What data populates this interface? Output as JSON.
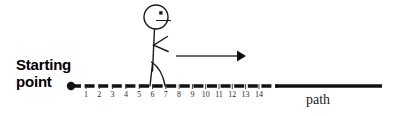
{
  "diagram": {
    "title_label": {
      "line1": "Starting",
      "line2": "point"
    },
    "path_label": "path",
    "axis": {
      "tick_labels": [
        "1",
        "2",
        "3",
        "4",
        "5",
        "6",
        "7",
        "8",
        "9",
        "10",
        "11",
        "12",
        "13",
        "14"
      ],
      "tick_start_x": 86,
      "tick_spacing": 13.3,
      "baseline_y": 86,
      "start_dot_x": 71,
      "dashed_end_x": 278,
      "line_end_x": 382
    },
    "figure": {
      "head_center_x": 156,
      "head_center_y": 17,
      "head_radius": 12,
      "eye_label": "eye-dot",
      "mouth_label": "mouth-line",
      "arm_label": "arm-chevron",
      "leg_label": "legs-walking"
    },
    "arrow": {
      "label": "motion-arrow",
      "start_x": 176,
      "end_x": 243,
      "y": 56
    },
    "colors": {
      "ink": "#000000",
      "line": "#111111",
      "tick_text": "#2b2b2b",
      "background": "#ffffff"
    }
  }
}
